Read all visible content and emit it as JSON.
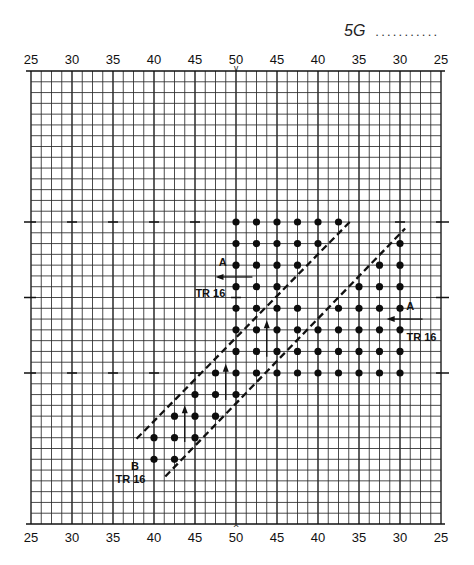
{
  "header": {
    "code": "5G",
    "leader_dots": "..........."
  },
  "chart_data": {
    "type": "scatter",
    "title": "5G",
    "xlabel": "",
    "ylabel": "",
    "x_ticks_top": [
      "25",
      "30",
      "35",
      "40",
      "45",
      "50",
      "45",
      "40",
      "35",
      "30",
      "25"
    ],
    "x_ticks_bottom": [
      "25",
      "30",
      "35",
      "40",
      "45",
      "50",
      "45",
      "40",
      "35",
      "30",
      "25"
    ],
    "center_marker_top": "v",
    "center_marker_bottom": "^",
    "grid": {
      "on": true,
      "cols": 40,
      "rows": 42,
      "left": 31,
      "right": 441,
      "top": 71,
      "bottom": 524,
      "major_every_cols": 4,
      "label_every_cols": 4
    },
    "tick_marks": [
      {
        "row": 14,
        "cols": [
          0,
          4,
          8,
          12,
          16,
          36,
          40
        ]
      },
      {
        "row": 21,
        "cols": [
          0,
          20,
          40
        ]
      },
      {
        "row": 28,
        "cols": [
          0,
          4,
          8,
          12,
          16,
          40
        ]
      }
    ],
    "points": [
      [
        20,
        14
      ],
      [
        22,
        14
      ],
      [
        24,
        14
      ],
      [
        26,
        14
      ],
      [
        28,
        14
      ],
      [
        30,
        14
      ],
      [
        20,
        16
      ],
      [
        22,
        16
      ],
      [
        24,
        16
      ],
      [
        26,
        16
      ],
      [
        28,
        16
      ],
      [
        36,
        16
      ],
      [
        20,
        18
      ],
      [
        22,
        18
      ],
      [
        24,
        18
      ],
      [
        26,
        18
      ],
      [
        34,
        18
      ],
      [
        36,
        18
      ],
      [
        20,
        20
      ],
      [
        22,
        20
      ],
      [
        24,
        20
      ],
      [
        32,
        20
      ],
      [
        34,
        20
      ],
      [
        36,
        20
      ],
      [
        20,
        22
      ],
      [
        22,
        22
      ],
      [
        24,
        22
      ],
      [
        26,
        22
      ],
      [
        30,
        22
      ],
      [
        32,
        22
      ],
      [
        34,
        22
      ],
      [
        36,
        22
      ],
      [
        20,
        24
      ],
      [
        22,
        24
      ],
      [
        24,
        24
      ],
      [
        26,
        24
      ],
      [
        28,
        24
      ],
      [
        30,
        24
      ],
      [
        32,
        24
      ],
      [
        34,
        24
      ],
      [
        36,
        24
      ],
      [
        20,
        26
      ],
      [
        22,
        26
      ],
      [
        24,
        26
      ],
      [
        26,
        26
      ],
      [
        28,
        26
      ],
      [
        30,
        26
      ],
      [
        32,
        26
      ],
      [
        34,
        26
      ],
      [
        36,
        26
      ],
      [
        18,
        28
      ],
      [
        20,
        28
      ],
      [
        22,
        28
      ],
      [
        24,
        28
      ],
      [
        26,
        28
      ],
      [
        28,
        28
      ],
      [
        30,
        28
      ],
      [
        32,
        28
      ],
      [
        34,
        28
      ],
      [
        36,
        28
      ],
      [
        16,
        30
      ],
      [
        18,
        30
      ],
      [
        20,
        30
      ],
      [
        14,
        32
      ],
      [
        16,
        32
      ],
      [
        18,
        32
      ],
      [
        12,
        34
      ],
      [
        14,
        34
      ],
      [
        16,
        34
      ],
      [
        12,
        36
      ],
      [
        14,
        36
      ]
    ],
    "dashed_lines": [
      {
        "name": "upper-boundary",
        "from": [
          10.3,
          34.1
        ],
        "to": [
          31.3,
          13.8
        ]
      },
      {
        "name": "lower-boundary",
        "from": [
          13.1,
          37.6
        ],
        "to": [
          36.5,
          14.6
        ]
      }
    ],
    "section_arrows": [
      {
        "name": "section-a-left-arrow",
        "from": [
          21.6,
          19.1
        ],
        "to": [
          18.0,
          19.1
        ]
      },
      {
        "name": "section-a-right-arrow",
        "from": [
          38.2,
          23.0
        ],
        "to": [
          34.7,
          23.0
        ]
      }
    ],
    "up_arrows": [
      {
        "col": 15,
        "tip_row": 31.0,
        "tail_row": 34.4
      },
      {
        "col": 19,
        "tip_row": 27.15,
        "tail_row": 30.5
      },
      {
        "col": 23,
        "tip_row": 23.1,
        "tail_row": 26.5
      }
    ],
    "annotations": [
      {
        "text": "A",
        "at": [
          18.7,
          17.7
        ]
      },
      {
        "text": "TR 16",
        "at": [
          17.5,
          20.6
        ]
      },
      {
        "text": "A",
        "at": [
          37.0,
          21.8
        ]
      },
      {
        "text": "TR 16",
        "at": [
          38.1,
          24.7
        ]
      },
      {
        "text": "B",
        "at": [
          10.15,
          36.6
        ]
      },
      {
        "text": "TR 16",
        "at": [
          9.7,
          37.85
        ]
      }
    ]
  }
}
